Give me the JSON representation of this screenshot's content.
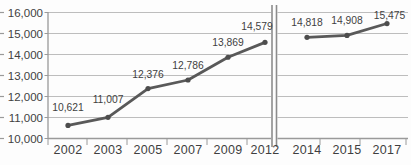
{
  "chart_data": {
    "type": "line",
    "title": "",
    "xlabel": "",
    "ylabel": "",
    "grid": true,
    "legend": false,
    "axis_break_between": [
      "2012",
      "2014"
    ],
    "y_axis": {
      "min": 10000,
      "max": 16000,
      "step": 1000,
      "tick_labels": [
        "16,000",
        "15,000",
        "14,000",
        "13,000",
        "12,000",
        "11,000",
        "10,000"
      ]
    },
    "panels": [
      {
        "name": "left-panel",
        "categories": [
          "2002",
          "2003",
          "2005",
          "2007",
          "2009",
          "2012"
        ],
        "values": [
          10621,
          11007,
          12376,
          12786,
          13869,
          14579
        ],
        "point_labels": [
          "10,621",
          "11,007",
          "12,376",
          "12,786",
          "13,869",
          "14,579"
        ]
      },
      {
        "name": "right-panel",
        "categories": [
          "2014",
          "2015",
          "2017"
        ],
        "values": [
          14818,
          14908,
          15475
        ],
        "point_labels": [
          "14,818",
          "14,908",
          "15,475"
        ]
      }
    ],
    "colors": {
      "line": "#595959",
      "marker": "#4d4d4d",
      "grid": "#bdbdbd",
      "axis": "#9a9a9a",
      "break_line": "#8c8c8c",
      "text": "#3f3f3f"
    }
  }
}
